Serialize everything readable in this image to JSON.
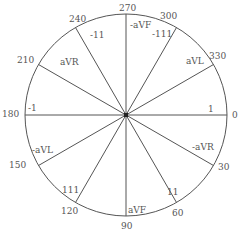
{
  "diagram": {
    "type": "hexaxial-reference-circle",
    "center": {
      "x": 126,
      "y": 115
    },
    "radius": 101,
    "stroke_color": "#555555",
    "axes": [
      {
        "angle": 0,
        "degree_label": "0",
        "lead_label": "1"
      },
      {
        "angle": 30,
        "degree_label": "30",
        "lead_label": "-aVR"
      },
      {
        "angle": 60,
        "degree_label": "60",
        "lead_label": "11"
      },
      {
        "angle": 90,
        "degree_label": "90",
        "lead_label": "aVF"
      },
      {
        "angle": 120,
        "degree_label": "120",
        "lead_label": "111"
      },
      {
        "angle": 150,
        "degree_label": "150",
        "lead_label": "-aVL"
      },
      {
        "angle": 180,
        "degree_label": "180",
        "lead_label": "-1"
      },
      {
        "angle": 210,
        "degree_label": "210",
        "lead_label": "aVR"
      },
      {
        "angle": 240,
        "degree_label": "240",
        "lead_label": "-11"
      },
      {
        "angle": 270,
        "degree_label": "270",
        "lead_label": "-aVF"
      },
      {
        "angle": 300,
        "degree_label": "300",
        "lead_label": "-111"
      },
      {
        "angle": 330,
        "degree_label": "330",
        "lead_label": "aVL"
      }
    ]
  }
}
